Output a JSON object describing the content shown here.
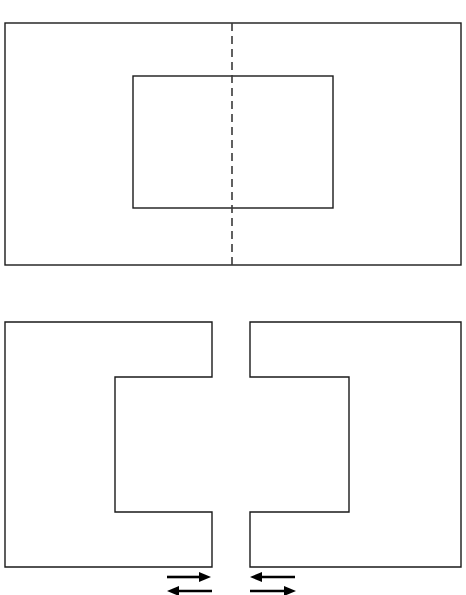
{
  "figure": {
    "background_color": "#ffffff",
    "line_color": "#1a1a1a",
    "arrow_color": "#000000",
    "centerline_color": "#3a3a3a",
    "canvas": {
      "width": 466,
      "height": 595
    }
  },
  "top_view": {
    "name": "top-view",
    "description": "Large rectangle containing a smaller concentric-width inner rectangle, split by a vertical dashed centerline",
    "outer_rect": {
      "x": 5,
      "y": 23,
      "width": 456,
      "height": 242
    },
    "inner_rect": {
      "x": 133,
      "y": 76,
      "width": 200,
      "height": 132
    },
    "centerline": {
      "x": 232,
      "y1": 23,
      "y2": 265,
      "dash": "8 5"
    }
  },
  "bottom_view": {
    "name": "bottom-view",
    "description": "Two mirrored C-shaped blocks separated by a vertical gap, with interlocking notches",
    "left_block": {
      "name": "left-c-block",
      "points": "5,322 212,322 212,377 115,377 115,512 212,512 212,567 5,567"
    },
    "right_block": {
      "name": "right-c-block",
      "points": "461,322 250,322 250,377 349,377 349,512 250,512 250,567 461,567"
    },
    "gap": {
      "x_left": 212,
      "x_right": 250,
      "width": 38
    }
  },
  "arrows": {
    "name": "motion-arrows",
    "items": [
      {
        "name": "arrow-left-group-top",
        "direction": "right",
        "x1": 167,
        "x2": 211,
        "y": 577
      },
      {
        "name": "arrow-left-group-bottom",
        "direction": "left",
        "x1": 167,
        "x2": 212,
        "y": 591
      },
      {
        "name": "arrow-right-group-top",
        "direction": "left",
        "x1": 250,
        "x2": 295,
        "y": 577
      },
      {
        "name": "arrow-right-group-bottom",
        "direction": "right",
        "x1": 250,
        "x2": 296,
        "y": 591
      }
    ]
  }
}
